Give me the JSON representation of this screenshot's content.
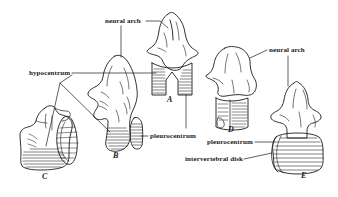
{
  "figure": {
    "background_color": "#ffffff",
    "ink_color": "#1a1a1a",
    "width": 338,
    "height": 197
  },
  "labels": {
    "neural_arch_left": "neural arch",
    "hypocentrum": "hypocentrum",
    "pleurocentrum_b": "pleurocentrum",
    "neural_arch_right": "neural arch",
    "pleurocentrum_e": "pleurocentrum",
    "intervertebral_disk": "intervertebral disk"
  },
  "specimens": [
    {
      "letter": "A",
      "parts": [
        "neural arch",
        "hypocentrum"
      ]
    },
    {
      "letter": "B",
      "parts": [
        "neural arch",
        "hypocentrum",
        "pleurocentrum"
      ]
    },
    {
      "letter": "C",
      "parts": [
        "hypocentrum"
      ]
    },
    {
      "letter": "D",
      "parts": [
        "neural arch",
        "pleurocentrum"
      ]
    },
    {
      "letter": "E",
      "parts": [
        "neural arch",
        "pleurocentrum",
        "intervertebral disk"
      ]
    }
  ]
}
